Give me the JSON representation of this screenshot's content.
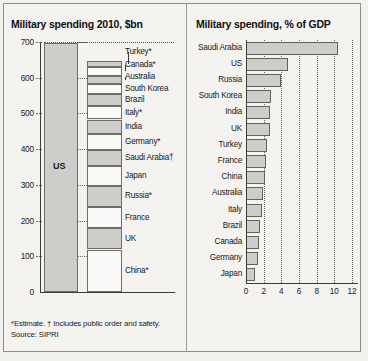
{
  "left": {
    "title": "Military spending 2010, $bn",
    "yticks": [
      0,
      100,
      200,
      300,
      400,
      500,
      600,
      700
    ],
    "us_label": "US",
    "footnote_line1": "*Estimate.  † Includes public order and safety.",
    "footnote_line2": "Source: SIPRI"
  },
  "right": {
    "title": "Military spending, % of GDP",
    "xticks": [
      0,
      2,
      4,
      6,
      8,
      10,
      12
    ]
  },
  "chart_data": [
    {
      "type": "bar",
      "id": "military-spending-usd",
      "title": "Military spending 2010, $bn",
      "xlabel": "",
      "ylabel": "$bn",
      "ylim": [
        0,
        700
      ],
      "grid": true,
      "note": "Left column is a single US bar; right column is a stacked column of the next 13 countries.",
      "columns": [
        {
          "name": "US",
          "stacked": false,
          "categories": [
            "US"
          ],
          "values": [
            698
          ]
        },
        {
          "name": "Next 13 countries combined",
          "stacked": true,
          "total": 650,
          "categories": [
            "China*",
            "UK",
            "France",
            "Russia*",
            "Japan",
            "Saudi Arabia†",
            "Germany*",
            "India",
            "Italy*",
            "Brazil",
            "South Korea",
            "Australia",
            "Canada*",
            "Turkey*"
          ],
          "values": [
            119,
            60,
            59,
            59,
            55,
            45,
            45,
            41,
            37,
            34,
            28,
            24,
            23,
            17
          ]
        }
      ],
      "footnote": "*Estimate.  † Includes public order and safety. Source: SIPRI"
    },
    {
      "type": "bar",
      "id": "military-spending-pct-gdp",
      "orientation": "horizontal",
      "title": "Military spending, % of GDP",
      "xlabel": "% of GDP",
      "ylabel": "",
      "xlim": [
        0,
        12
      ],
      "grid": true,
      "categories": [
        "Saudi Arabia",
        "US",
        "Russia",
        "South Korea",
        "India",
        "UK",
        "Turkey",
        "France",
        "China",
        "Australia",
        "Italy",
        "Brazil",
        "Canada",
        "Germany",
        "Japan"
      ],
      "values": [
        10.4,
        4.8,
        4.0,
        2.8,
        2.7,
        2.7,
        2.4,
        2.3,
        2.1,
        1.9,
        1.8,
        1.6,
        1.5,
        1.4,
        1.0
      ]
    }
  ]
}
